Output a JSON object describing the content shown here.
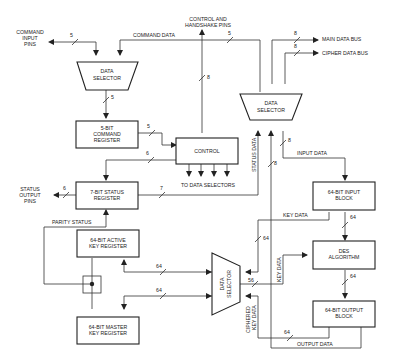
{
  "caption_fragment": "",
  "external_pins": {
    "command_input": [
      "COMMAND",
      "INPUT",
      "PINS"
    ],
    "control_handshake": [
      "CONTROL AND",
      "HANDSHAKE PINS"
    ],
    "main_data_bus": "MAIN DATA BUS",
    "cipher_data_bus": "CIPHER DATA BUS",
    "status_output": [
      "STATUS",
      "OUTPUT",
      "PINS"
    ]
  },
  "blocks": {
    "data_selector_top_left": [
      "DATA",
      "SELECTOR"
    ],
    "data_selector_top_right": [
      "DATA",
      "SELECTOR"
    ],
    "data_selector_bottom": [
      "DATA",
      "SELECTOR"
    ],
    "command_register": [
      "5-BIT",
      "COMMAND",
      "REGISTER"
    ],
    "control": "CONTROL",
    "status_register": [
      "7-BIT STATUS",
      "REGISTER"
    ],
    "input_block": [
      "64-BIT INPUT",
      "BLOCK"
    ],
    "des_algorithm": [
      "DES",
      "ALGORITHM"
    ],
    "output_block": [
      "64-BIT OUTPUT",
      "BLOCK"
    ],
    "active_key_register": [
      "64-BIT ACTIVE",
      "KEY REGISTER"
    ],
    "master_key_register": [
      "64-BIT MASTER",
      "KEY REGISTER"
    ]
  },
  "signals": {
    "command_data": "COMMAND DATA",
    "to_data_selectors": "TO DATA SELECTORS",
    "status_data": "STATUS DATA",
    "input_data": "INPUT DATA",
    "key_data_h": "KEY DATA",
    "key_data_v": "KEY DATA",
    "parity_status": "PARITY STATUS",
    "ciphered_key_data": [
      "CIPHERED",
      "KEY DATA"
    ],
    "output_data": "OUTPUT DATA"
  },
  "bus_widths": {
    "cmd_in": "5",
    "cmd_data": "5",
    "sel_out": "5",
    "main_bus": "8",
    "cipher_bus": "8",
    "ctrl_pins": "8",
    "cmd_reg_out": "5",
    "ctrl_to_status": "6",
    "status_out": "6",
    "status_to_sel": "7",
    "input_data": "8",
    "sel_down": "8",
    "input_to_des": "64",
    "key_to_sel": "64",
    "sel_to_des": "56",
    "des_to_out": "64",
    "active_key": "64",
    "master_key": "64",
    "out_to_sel": "64"
  }
}
